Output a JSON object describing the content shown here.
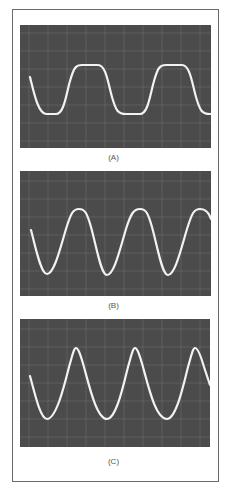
{
  "figure": {
    "panels": [
      {
        "id": "A",
        "label": "(A)",
        "description": "Oscilloscope trace: clipped/flattened sine wave (nearly square, rounded)",
        "waveform": "clipped-sine"
      },
      {
        "id": "B",
        "label": "(B)",
        "description": "Oscilloscope trace: slightly distorted sine wave (flattened peaks)",
        "waveform": "soft-clipped-sine"
      },
      {
        "id": "C",
        "label": "(C)",
        "description": "Oscilloscope trace: clean sine wave",
        "waveform": "sine"
      }
    ],
    "colors": {
      "screen": "#4b4b4b",
      "grid": "#8c8c8c",
      "trace": "#f2f2f2",
      "border": "#6a6a6a",
      "caption": "#555555"
    }
  }
}
